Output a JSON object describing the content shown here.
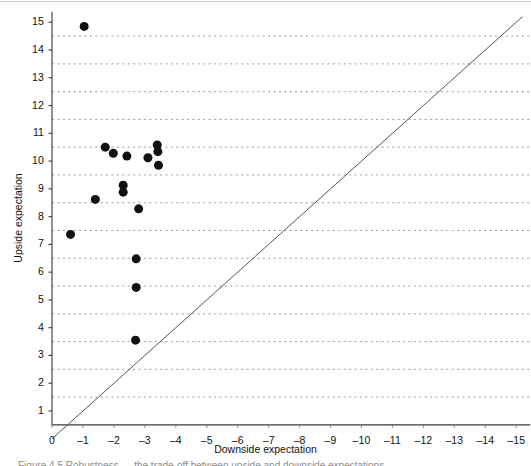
{
  "figure": {
    "caption_fragment": "Figure 4.5 Robustness — the trade-off between upside and downside expectations"
  },
  "chart_data": {
    "type": "scatter",
    "title": "",
    "xlabel": "Downside expectation",
    "ylabel": "Upside expectation",
    "xlim": [
      0,
      -15
    ],
    "ylim": [
      0.5,
      15.4
    ],
    "x_ticks": [
      "0",
      "–1",
      "–2",
      "–3",
      "–4",
      "–5",
      "–6",
      "–7",
      "–8",
      "–9",
      "–10",
      "–11",
      "–12",
      "–13",
      "–14",
      "–15"
    ],
    "x_tick_values": [
      0,
      -1,
      -2,
      -3,
      -4,
      -5,
      -6,
      -7,
      -8,
      -9,
      -10,
      -11,
      -12,
      -13,
      -14,
      -15
    ],
    "y_ticks": [
      "1",
      "2",
      "3",
      "4",
      "5",
      "6",
      "7",
      "8",
      "9",
      "10",
      "11",
      "12",
      "13",
      "14",
      "15"
    ],
    "y_tick_values": [
      1,
      2,
      3,
      4,
      5,
      6,
      7,
      8,
      9,
      10,
      11,
      12,
      13,
      14,
      15
    ],
    "grid": {
      "horizontal": true,
      "vertical": false,
      "style": "dotted",
      "y_values": [
        1.5,
        2.5,
        3.5,
        4.5,
        5.5,
        6.5,
        7.5,
        8.5,
        9.5,
        10.5,
        11.5,
        12.5,
        13.5,
        14.5
      ],
      "color": "#9a9a9a"
    },
    "legend": null,
    "reference_line": {
      "name": "diagonal-equal-line",
      "description": "y = -x reference diagonal",
      "from": [
        0,
        0
      ],
      "to": [
        -15.2,
        15.2
      ],
      "color": "#555555"
    },
    "marker": {
      "shape": "circle",
      "color": "#111111",
      "size_px": 9
    },
    "series": [
      {
        "name": "Design options",
        "color": "#111111",
        "points": [
          {
            "x": -1.04,
            "y": 14.85
          },
          {
            "x": -0.6,
            "y": 7.36
          },
          {
            "x": -1.4,
            "y": 8.62
          },
          {
            "x": -1.72,
            "y": 10.5
          },
          {
            "x": -1.98,
            "y": 10.28
          },
          {
            "x": -2.3,
            "y": 9.13
          },
          {
            "x": -2.3,
            "y": 8.88
          },
          {
            "x": -2.42,
            "y": 10.18
          },
          {
            "x": -2.8,
            "y": 8.28
          },
          {
            "x": -2.72,
            "y": 6.48
          },
          {
            "x": -2.72,
            "y": 5.45
          },
          {
            "x": -2.7,
            "y": 3.55
          },
          {
            "x": -3.1,
            "y": 10.12
          },
          {
            "x": -3.4,
            "y": 10.58
          },
          {
            "x": -3.42,
            "y": 10.34
          },
          {
            "x": -3.44,
            "y": 9.85
          }
        ]
      }
    ]
  }
}
